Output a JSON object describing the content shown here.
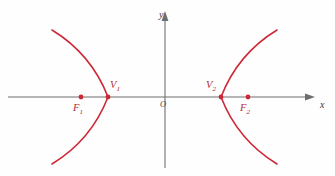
{
  "figure": {
    "background_color": "#fefefe",
    "width": 335,
    "height": 176
  },
  "colors": {
    "curve": "#cc2936",
    "axis": "#6e6e6e",
    "point": "#cc2936",
    "point_label": "#b02a34",
    "axis_label": "#3a3a3a",
    "origin_label": "#4a4a4a"
  },
  "axes": {
    "x_label": "x",
    "y_label": "y",
    "origin_label": "O",
    "x_axis": {
      "x_start": 8,
      "x_end": 315,
      "y": 97,
      "arrow_end": "right"
    },
    "y_axis": {
      "y_start": 12,
      "y_end": 168,
      "x": 165,
      "arrow_end": "top"
    }
  },
  "points": [
    {
      "id": "F1",
      "name": "left-focus",
      "label": "F",
      "subscript": "1",
      "x": 81,
      "y": 97
    },
    {
      "id": "V1",
      "name": "left-vertex",
      "label": "V",
      "subscript": "1",
      "x": 108,
      "y": 97
    },
    {
      "id": "V2",
      "name": "right-vertex",
      "label": "V",
      "subscript": "2",
      "x": 221,
      "y": 97
    },
    {
      "id": "F2",
      "name": "right-focus",
      "label": "F",
      "subscript": "2",
      "x": 248,
      "y": 97
    }
  ],
  "chart_data": {
    "type": "line",
    "xlabel": "x",
    "ylabel": "y",
    "grid": false,
    "legend": null,
    "origin_px": {
      "x": 165,
      "y": 97
    },
    "annotations": [
      {
        "text": "F1",
        "x": 81,
        "y": 97
      },
      {
        "text": "V1",
        "x": 108,
        "y": 97
      },
      {
        "text": "O",
        "x": 165,
        "y": 97
      },
      {
        "text": "V2",
        "x": 221,
        "y": 97
      },
      {
        "text": "F2",
        "x": 248,
        "y": 97
      }
    ],
    "series": [
      {
        "name": "left-branch",
        "path": "M 52,30 C 75,44 96,66 108,97 C 96,128 75,150 52,164"
      },
      {
        "name": "right-branch",
        "path": "M 277,30 C 254,44 233,66 221,97 C 233,128 254,150 277,164"
      }
    ]
  }
}
